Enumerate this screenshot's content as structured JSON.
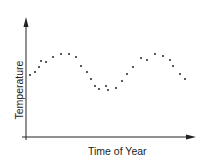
{
  "chart_data": {
    "type": "scatter",
    "title": "",
    "xlabel": "Time of Year",
    "ylabel": "Temperature",
    "x_ticks": [],
    "y_ticks": [],
    "grid": false,
    "legend": null,
    "series": [
      {
        "name": "Temperature",
        "points": [
          [
            30,
            75
          ],
          [
            35,
            72
          ],
          [
            39,
            67
          ],
          [
            41,
            61
          ],
          [
            46,
            62
          ],
          [
            53,
            57
          ],
          [
            61,
            54
          ],
          [
            69,
            54
          ],
          [
            76,
            57
          ],
          [
            81,
            66
          ],
          [
            87,
            72
          ],
          [
            91,
            79
          ],
          [
            95,
            86
          ],
          [
            99,
            89
          ],
          [
            106,
            86
          ],
          [
            108,
            90
          ],
          [
            116,
            88
          ],
          [
            122,
            81
          ],
          [
            127,
            74
          ],
          [
            133,
            67
          ],
          [
            141,
            58
          ],
          [
            147,
            60
          ],
          [
            155,
            54
          ],
          [
            163,
            56
          ],
          [
            170,
            60
          ],
          [
            173,
            66
          ],
          [
            180,
            74
          ],
          [
            185,
            79
          ]
        ]
      }
    ]
  },
  "axes": {
    "x_label": "Time of Year",
    "y_label": "Temperature",
    "color": "#222222"
  }
}
